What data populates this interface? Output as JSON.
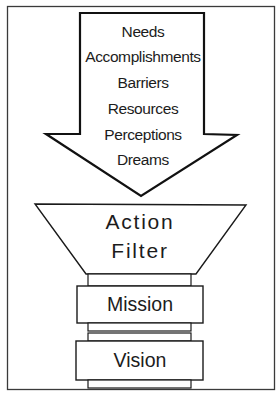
{
  "diagram": {
    "type": "flow",
    "arrow": {
      "direction": "down",
      "items": [
        "Needs",
        "Accomplishments",
        "Barriers",
        "Resources",
        "Perceptions",
        "Dreams"
      ]
    },
    "filter": {
      "shape": "funnel-trapezoid",
      "line1": "Action",
      "line2": "Filter"
    },
    "stack": [
      {
        "label": "Mission"
      },
      {
        "label": "Vision"
      }
    ],
    "colors": {
      "stroke": "#1a1a1a",
      "frame": "#3a3a3a",
      "fill": "#ffffff",
      "text": "#1c1c1c"
    }
  }
}
